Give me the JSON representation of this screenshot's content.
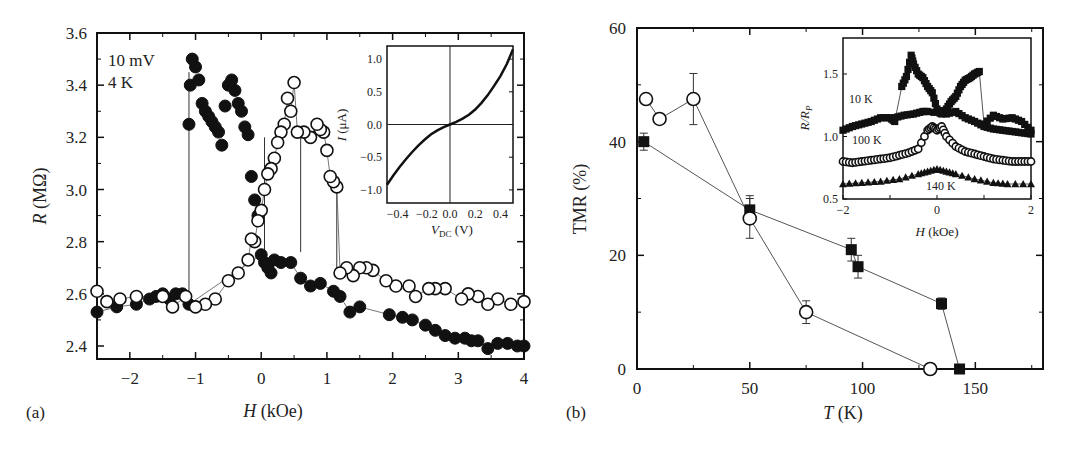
{
  "chart_data": [
    {
      "panel": "(a)",
      "type": "scatter",
      "title": "",
      "xlabel": "H (kOe)",
      "ylabel": "R (MΩ)",
      "xlim": [
        -2.5,
        4
      ],
      "ylim": [
        2.35,
        3.6
      ],
      "xticks": [
        "−2",
        "−1",
        "0",
        "1",
        "2",
        "3",
        "4"
      ],
      "xtick_values": [
        -2,
        -1,
        0,
        1,
        2,
        3,
        4
      ],
      "yticks": [
        "2.4",
        "2.6",
        "2.8",
        "3.0",
        "3.2",
        "3.4",
        "3.6"
      ],
      "ytick_values": [
        2.4,
        2.6,
        2.8,
        3.0,
        3.2,
        3.4,
        3.6
      ],
      "grid": false,
      "annotations": [
        "10 mV",
        "4 K"
      ],
      "series": [
        {
          "name": "sweep up (filled)",
          "marker": "filled-circle",
          "x": [
            -2.5,
            -2.2,
            -1.9,
            -1.7,
            -1.6,
            -1.5,
            -1.4,
            -1.3,
            -1.2,
            -1.1,
            -1.1,
            -1.08,
            -1.05,
            -1.0,
            -0.95,
            -0.9,
            -0.85,
            -0.8,
            -0.75,
            -0.7,
            -0.65,
            -0.6,
            -0.55,
            -0.5,
            -0.45,
            -0.4,
            -0.35,
            -0.3,
            -0.25,
            -0.2,
            -0.15,
            -0.1,
            -0.05,
            0.0,
            0.05,
            0.1,
            0.15,
            0.2,
            0.3,
            0.45,
            0.6,
            0.75,
            0.9,
            1.1,
            1.2,
            1.35,
            1.5,
            1.95,
            2.15,
            2.3,
            2.5,
            2.65,
            2.8,
            2.95,
            3.1,
            3.2,
            3.3,
            3.45,
            3.6,
            3.75,
            3.9,
            4.0
          ],
          "y": [
            2.53,
            2.55,
            2.56,
            2.58,
            2.59,
            2.6,
            2.58,
            2.6,
            2.6,
            2.56,
            3.25,
            3.4,
            3.5,
            3.47,
            3.42,
            3.33,
            3.3,
            3.28,
            3.26,
            3.24,
            3.22,
            3.17,
            3.32,
            3.4,
            3.42,
            3.38,
            3.33,
            3.3,
            3.24,
            3.21,
            3.05,
            2.96,
            2.9,
            2.75,
            2.72,
            2.7,
            2.68,
            2.73,
            2.72,
            2.72,
            2.66,
            2.63,
            2.64,
            2.61,
            2.59,
            2.53,
            2.55,
            2.52,
            2.51,
            2.5,
            2.48,
            2.46,
            2.44,
            2.43,
            2.43,
            2.42,
            2.42,
            2.39,
            2.41,
            2.41,
            2.4,
            2.4
          ]
        },
        {
          "name": "sweep down (open)",
          "marker": "open-circle",
          "x": [
            4.0,
            3.8,
            3.6,
            3.45,
            3.3,
            3.15,
            3.05,
            2.8,
            2.65,
            2.55,
            2.35,
            2.25,
            2.05,
            1.9,
            1.7,
            1.6,
            1.5,
            1.4,
            1.3,
            1.2,
            1.15,
            1.1,
            1.05,
            1.0,
            0.95,
            0.9,
            0.85,
            0.75,
            0.65,
            0.55,
            0.5,
            0.45,
            0.4,
            0.35,
            0.3,
            0.25,
            0.2,
            0.15,
            0.1,
            0.05,
            0.0,
            -0.05,
            -0.1,
            -0.15,
            -0.2,
            -0.35,
            -0.5,
            -0.7,
            -0.85,
            -1.0,
            -1.15,
            -1.35,
            -1.5,
            -1.9,
            -2.15,
            -2.35,
            -2.5
          ],
          "y": [
            2.57,
            2.56,
            2.58,
            2.56,
            2.59,
            2.6,
            2.58,
            2.62,
            2.62,
            2.62,
            2.59,
            2.63,
            2.63,
            2.65,
            2.69,
            2.7,
            2.7,
            2.67,
            2.7,
            2.68,
            3.01,
            3.03,
            3.05,
            3.15,
            3.22,
            3.23,
            3.25,
            3.2,
            3.22,
            3.22,
            3.41,
            3.3,
            3.35,
            3.25,
            3.22,
            3.18,
            3.12,
            3.08,
            3.06,
            3.0,
            2.92,
            2.88,
            2.8,
            2.81,
            2.73,
            2.68,
            2.65,
            2.58,
            2.56,
            2.55,
            2.59,
            2.55,
            2.59,
            2.59,
            2.58,
            2.57,
            2.61
          ]
        }
      ],
      "vertical_jump_lines_x": [
        -1.1,
        0.05,
        1.15
      ],
      "inset": {
        "type": "line",
        "xlabel": "V_DC (V)",
        "ylabel": "I (μA)",
        "xlim": [
          -0.5,
          0.5
        ],
        "ylim": [
          -1.2,
          1.2
        ],
        "xticks": [
          "−0.4",
          "−0.2",
          "0.0",
          "0.2",
          "0.4"
        ],
        "yticks": [
          "−1.0",
          "−0.5",
          "0.0",
          "0.5",
          "1.0"
        ],
        "x": [
          -0.5,
          -0.45,
          -0.4,
          -0.35,
          -0.3,
          -0.25,
          -0.2,
          -0.15,
          -0.1,
          -0.05,
          0.0,
          0.05,
          0.1,
          0.15,
          0.2,
          0.25,
          0.3,
          0.35,
          0.4,
          0.45,
          0.5
        ],
        "y": [
          -0.92,
          -0.78,
          -0.65,
          -0.53,
          -0.42,
          -0.32,
          -0.23,
          -0.15,
          -0.09,
          -0.04,
          0.0,
          0.04,
          0.09,
          0.15,
          0.23,
          0.33,
          0.45,
          0.59,
          0.74,
          0.92,
          1.15
        ]
      }
    },
    {
      "panel": "(b)",
      "type": "line",
      "title": "",
      "xlabel": "T (K)",
      "ylabel": "TMR (%)",
      "xlim": [
        0,
        180
      ],
      "ylim": [
        0,
        60
      ],
      "xticks": [
        "0",
        "50",
        "100",
        "150"
      ],
      "xtick_values": [
        0,
        50,
        100,
        150
      ],
      "yticks": [
        "0",
        "20",
        "40",
        "60"
      ],
      "ytick_values": [
        0,
        20,
        40,
        60
      ],
      "grid": false,
      "series": [
        {
          "name": "squares",
          "marker": "filled-square",
          "x": [
            3,
            50,
            95,
            98,
            135,
            143
          ],
          "y": [
            40,
            28,
            21,
            18,
            11.5,
            0
          ],
          "yerr": [
            1.5,
            2.5,
            2,
            2,
            1,
            0
          ]
        },
        {
          "name": "circles",
          "marker": "open-circle",
          "x": [
            4,
            10,
            25,
            50,
            75,
            130
          ],
          "y": [
            47.5,
            44,
            47.5,
            26.5,
            10,
            0
          ],
          "yerr": [
            0,
            0,
            4.5,
            3.5,
            2,
            0
          ]
        }
      ],
      "inset": {
        "type": "scatter",
        "xlabel": "H (kOe)",
        "ylabel": "R/R_P",
        "xlim": [
          -2,
          2
        ],
        "ylim": [
          0.5,
          1.7
        ],
        "xticks": [
          "−2",
          "0",
          "2"
        ],
        "yticks": [
          "0.5",
          "1.0",
          "1.5"
        ],
        "series": [
          {
            "name": "10 K",
            "marker": "filled-square",
            "x": [
              -2,
              -1.8,
              -1.6,
              -1.4,
              -1.2,
              -1.0,
              -0.9,
              -0.75,
              -0.65,
              -0.55,
              -0.5,
              -0.4,
              -0.3,
              -0.2,
              -0.1,
              0.0,
              0.1,
              0.2,
              0.3,
              0.4,
              0.5,
              0.6,
              0.7,
              0.8,
              0.9,
              1.0,
              1.2,
              1.4,
              1.6,
              1.8,
              2.0
            ],
            "y": [
              1.05,
              1.08,
              1.1,
              1.12,
              1.15,
              1.15,
              1.12,
              1.4,
              1.48,
              1.65,
              1.58,
              1.5,
              1.47,
              1.4,
              1.35,
              1.22,
              1.18,
              1.22,
              1.28,
              1.32,
              1.4,
              1.45,
              1.47,
              1.5,
              1.52,
              1.1,
              1.17,
              1.14,
              1.15,
              1.12,
              1.05
            ]
          },
          {
            "name": "10 K (return)",
            "marker": "filled-square",
            "x": [
              -0.9,
              -0.7,
              -0.5,
              -0.3,
              -0.2,
              0.2,
              0.4,
              0.6,
              0.8,
              1.0,
              1.2,
              1.4,
              1.6,
              1.8,
              2.0
            ],
            "y": [
              1.15,
              1.17,
              1.18,
              1.2,
              1.2,
              1.18,
              1.2,
              1.15,
              1.12,
              1.08,
              1.06,
              1.05,
              1.04,
              1.03,
              1.02
            ]
          },
          {
            "name": "100 K",
            "marker": "open-circle",
            "x": [
              -2,
              -1.8,
              -1.6,
              -1.4,
              -1.2,
              -1.0,
              -0.8,
              -0.6,
              -0.4,
              -0.2,
              -0.1,
              0.0,
              0.1,
              0.2,
              0.4,
              0.6,
              0.8,
              1.0,
              1.2,
              1.4,
              1.6,
              1.8,
              2.0
            ],
            "y": [
              0.8,
              0.79,
              0.8,
              0.81,
              0.82,
              0.83,
              0.85,
              0.87,
              0.9,
              1.05,
              1.08,
              1.05,
              1.08,
              1.0,
              0.92,
              0.88,
              0.86,
              0.84,
              0.82,
              0.81,
              0.8,
              0.8,
              0.8
            ]
          },
          {
            "name": "140 K",
            "marker": "filled-triangle",
            "x": [
              -2,
              -1.6,
              -1.2,
              -0.8,
              -0.4,
              -0.2,
              0.0,
              0.2,
              0.4,
              0.8,
              1.2,
              1.5,
              2.0
            ],
            "y": [
              0.62,
              0.63,
              0.64,
              0.66,
              0.7,
              0.72,
              0.74,
              0.72,
              0.7,
              0.66,
              0.63,
              0.62,
              0.62
            ]
          }
        ],
        "annotations": [
          "10 K",
          "100 K",
          "140 K"
        ]
      }
    }
  ],
  "panel_a": {
    "label": "(a)",
    "xlabel_italic": "H",
    "xlabel_unit": " (kOe)",
    "ylabel_italic": "R",
    "ylabel_unit": " (MΩ)",
    "annot_voltage": "10 mV",
    "annot_temp": "4 K",
    "xticks": [
      "−2",
      "−1",
      "0",
      "1",
      "2",
      "3",
      "4"
    ],
    "yticks": [
      "2.4",
      "2.6",
      "2.8",
      "3.0",
      "3.2",
      "3.4",
      "3.6"
    ],
    "inset": {
      "xlabel_italic": "V",
      "xlabel_sub": "DC",
      "xlabel_unit": " (V)",
      "ylabel_italic": "I",
      "ylabel_unit": " (μA)",
      "xticks": [
        "−0.4",
        "−0.2",
        "0.0",
        "0.2",
        "0.4"
      ],
      "yticks": [
        "1.0",
        "0.5",
        "0.0",
        "−0.5",
        "−1.0"
      ]
    }
  },
  "panel_b": {
    "label": "(b)",
    "xlabel_italic": "T",
    "xlabel_unit": " (K)",
    "ylabel": "TMR (%)",
    "xticks": [
      "0",
      "50",
      "100",
      "150"
    ],
    "yticks": [
      "0",
      "20",
      "40",
      "60"
    ],
    "inset": {
      "xlabel_italic": "H",
      "xlabel_unit": " (kOe)",
      "ylabel_italic": "R/R",
      "ylabel_sub": "P",
      "xticks": [
        "−2",
        "0",
        "2"
      ],
      "yticks": [
        "0.5",
        "1.0",
        "1.5"
      ],
      "label_10k": "10 K",
      "label_100k": "100 K",
      "label_140k": "140 K"
    }
  },
  "colors": {
    "ink": "#111111",
    "line": "#555555",
    "background": "#ffffff"
  }
}
